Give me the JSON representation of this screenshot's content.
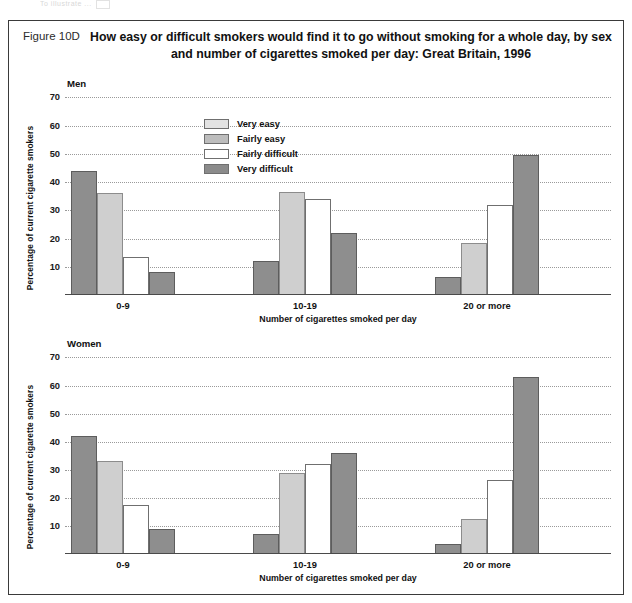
{
  "scan_remnant": "To illustrate ...",
  "figure": {
    "number": "Figure 10D",
    "title": "How easy or difficult smokers would find it to go without smoking for a whole day, by sex and number of cigarettes smoked per day: Great Britain, 1996"
  },
  "legend": {
    "items": [
      {
        "label": "Very easy",
        "key": "very_easy",
        "swatch": "#e3e3e3"
      },
      {
        "label": "Fairly easy",
        "key": "fairly_easy",
        "swatch": "#bdbdbd"
      },
      {
        "label": "Fairly difficult",
        "key": "fairly_difficult",
        "swatch": "#ffffff"
      },
      {
        "label": "Very difficult",
        "key": "very_difficult",
        "swatch": "#8b8b8b"
      }
    ]
  },
  "axes": {
    "ylabel": "Percentage of current cigarette smokers",
    "xlabel": "Number of cigarettes smoked per day",
    "yticks": [
      10,
      20,
      30,
      40,
      50,
      60,
      70
    ],
    "ymin": 0,
    "ymax": 73,
    "categories": [
      "0-9",
      "10-19",
      "20 or more"
    ]
  },
  "panels": [
    {
      "label": "Men",
      "key": "men"
    },
    {
      "label": "Women",
      "key": "women"
    }
  ],
  "chart_data": [
    {
      "type": "bar",
      "title": "Men",
      "subtitle": "How easy or difficult smokers would find it to go without smoking for a whole day, by sex and number of cigarettes smoked per day: Great Britain, 1996",
      "xlabel": "Number of cigarettes smoked per day",
      "ylabel": "Percentage of current cigarette smokers",
      "categories": [
        "0-9",
        "10-19",
        "20 or more"
      ],
      "ylim": [
        0,
        73
      ],
      "yticks": [
        10,
        20,
        30,
        40,
        50,
        60,
        70
      ],
      "grid": true,
      "legend_position": "top-left-inside",
      "series": [
        {
          "name": "Very easy",
          "values": [
            44,
            12,
            6.5
          ]
        },
        {
          "name": "Fairly easy",
          "values": [
            36,
            36.5,
            18.5
          ]
        },
        {
          "name": "Fairly difficult",
          "values": [
            13.5,
            34,
            32
          ]
        },
        {
          "name": "Very difficult",
          "values": [
            8,
            22,
            49.5
          ]
        }
      ]
    },
    {
      "type": "bar",
      "title": "Women",
      "xlabel": "Number of cigarettes smoked per day",
      "ylabel": "Percentage of current cigarette smokers",
      "categories": [
        "0-9",
        "10-19",
        "20 or more"
      ],
      "ylim": [
        0,
        73
      ],
      "yticks": [
        10,
        20,
        30,
        40,
        50,
        60,
        70
      ],
      "grid": true,
      "legend_position": "none",
      "series": [
        {
          "name": "Very easy",
          "values": [
            42,
            7,
            3.5
          ]
        },
        {
          "name": "Fairly easy",
          "values": [
            33,
            29,
            12.5
          ]
        },
        {
          "name": "Fairly difficult",
          "values": [
            17.5,
            32,
            26.5
          ]
        },
        {
          "name": "Very difficult",
          "values": [
            9,
            36,
            63
          ]
        }
      ]
    }
  ]
}
